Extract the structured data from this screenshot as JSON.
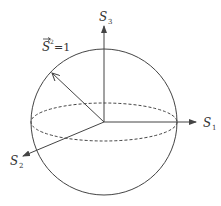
{
  "diagram": {
    "equation": {
      "base": "S",
      "exponent": "2",
      "rhs": "=1",
      "has_vector_arrow": true
    },
    "axes": [
      {
        "name": "S",
        "subscript": "1",
        "direction": "right"
      },
      {
        "name": "S",
        "subscript": "2",
        "direction": "front-left"
      },
      {
        "name": "S",
        "subscript": "3",
        "direction": "up"
      }
    ],
    "elements": [
      "sphere outline",
      "dashed equator ellipse",
      "state vector arrow"
    ],
    "colors": {
      "stroke": "#444444",
      "text": "#333333",
      "background": "#ffffff"
    }
  }
}
